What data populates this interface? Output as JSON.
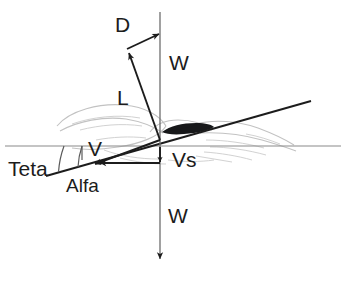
{
  "figure": {
    "background_color": "#ffffff",
    "ink_color": "#1c1c1c",
    "reference_line_color": "#8a8a8a",
    "silhouette_color": "#c2c2c2",
    "body_color": "#17181a",
    "width": 346,
    "height": 281
  },
  "labels": {
    "drag": "D",
    "weight_upper": "W",
    "lift": "L",
    "velocity": "V",
    "sink_speed": "Vs",
    "weight_lower": "W",
    "theta": "Teta",
    "alpha": "Alfa"
  },
  "vectors": [
    {
      "name": "lift",
      "label": "L",
      "from": [
        160,
        140
      ],
      "to": [
        128,
        51
      ],
      "arrowhead": "at-tip",
      "description": "Lift force, perpendicular to flight path, points up and to the left"
    },
    {
      "name": "drag",
      "label": "D",
      "from": [
        128,
        51
      ],
      "to": [
        160,
        35
      ],
      "arrowhead": "at-tip",
      "description": "Drag force, parallel to flight path, points up and to the right toward the vertical"
    },
    {
      "name": "weight-upper-segment",
      "label": "W",
      "from": [
        160,
        12
      ],
      "to": [
        160,
        140
      ],
      "arrowhead": "none",
      "description": "Vertical construction line above the centre of gravity"
    },
    {
      "name": "weight",
      "label": "W",
      "from": [
        160,
        140
      ],
      "to": [
        160,
        263
      ],
      "arrowhead": "at-tip",
      "description": "Weight force, straight down"
    },
    {
      "name": "velocity",
      "label": "V",
      "from": [
        160,
        140
      ],
      "to": [
        93,
        164
      ],
      "arrowhead": "at-tip",
      "description": "Airspeed vector along the flight path, down and to the left"
    },
    {
      "name": "sink-speed",
      "label": "Vs",
      "from": [
        160,
        145
      ],
      "to": [
        160,
        163
      ],
      "arrowhead": "at-tip",
      "description": "Sink speed, vertical component of the velocity"
    },
    {
      "name": "horizontal-velocity-component",
      "label": "",
      "from": [
        160,
        163
      ],
      "to": [
        98,
        163
      ],
      "arrowhead": "at-tip",
      "description": "Horizontal component of velocity"
    }
  ],
  "reference_lines": [
    {
      "name": "horizon",
      "from": [
        5,
        146
      ],
      "to": [
        341,
        146
      ],
      "description": "Horizontal reference (horizon) line"
    },
    {
      "name": "chord-line",
      "from": [
        46,
        176
      ],
      "to": [
        311,
        101
      ],
      "description": "Body / chord axis line of the bird, tilted up to the right"
    }
  ],
  "angles": [
    {
      "name": "theta",
      "label": "Teta",
      "vertex": [
        160,
        140
      ],
      "between": [
        "horizon",
        "velocity"
      ],
      "description": "Glide angle between the horizon and the flight path"
    },
    {
      "name": "alpha",
      "label": "Alfa",
      "vertex": [
        160,
        140
      ],
      "between": [
        "chord-line",
        "velocity"
      ],
      "description": "Angle of attack between the chord line and the flight path"
    }
  ],
  "label_positions": {
    "drag": [
      122,
      28
    ],
    "weight_upper": [
      172,
      68
    ],
    "lift": [
      119,
      104
    ],
    "velocity": [
      90,
      155
    ],
    "sink_speed": [
      173,
      166
    ],
    "weight_lower": [
      171,
      222
    ],
    "theta": [
      8,
      176
    ],
    "alpha": [
      68,
      192
    ]
  }
}
